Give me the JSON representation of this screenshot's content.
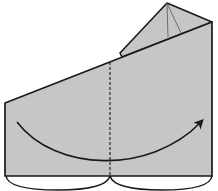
{
  "diagram": {
    "type": "origami-step",
    "description": "Paper model folded in half along the dashed valley fold line; arrow indicates folding the left half over to the right.",
    "colors": {
      "paper": "#c6c6c6",
      "outline": "#1a1a1a",
      "background": "#ffffff"
    },
    "elements": {
      "paper_body": "main-paper-body",
      "top_flap": "triangular-top-flap",
      "fold_line": "dashed-valley-fold-line",
      "fold_arrow": "curved-fold-arrow",
      "bottom_edges": "rounded-bottom-edges"
    },
    "fold": {
      "kind": "valley",
      "direction": "left-to-right"
    }
  }
}
